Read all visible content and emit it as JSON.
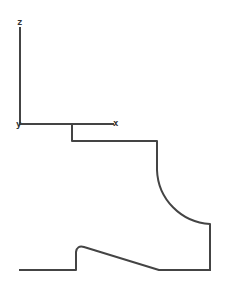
{
  "diagram": {
    "type": "2D profile sketch with axis triad",
    "stroke_color": "#444444",
    "axes": {
      "z_label": "z",
      "x_label": "x",
      "y_label": "y"
    },
    "profile": {
      "description": "Closed-ish outline: step below x-axis, vertical wall, concave quarter arc, right wall, bottom line with sloped bump"
    }
  }
}
